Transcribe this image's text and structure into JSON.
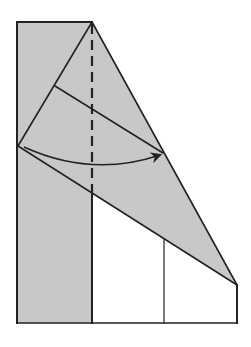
{
  "diagram": {
    "type": "origami-fold-step",
    "colors": {
      "background": "#ffffff",
      "paper_shaded": "#c8c8c8",
      "line": "#222222"
    },
    "shapes": {
      "left_strip": [
        [
          17,
          22
        ],
        [
          92,
          22
        ],
        [
          92,
          323
        ],
        [
          17,
          323
        ]
      ],
      "triangle_flap": [
        [
          18,
          146
        ],
        [
          92,
          22
        ],
        [
          237,
          285
        ]
      ],
      "lower_white_panel": [
        [
          92,
          193
        ],
        [
          237,
          285
        ],
        [
          237,
          323
        ],
        [
          92,
          323
        ]
      ]
    },
    "lines": {
      "left_edge": [
        [
          17,
          22
        ],
        [
          17,
          323
        ]
      ],
      "top_edge": [
        [
          17,
          22
        ],
        [
          92,
          22
        ]
      ],
      "long_diagonal": [
        [
          92,
          22
        ],
        [
          237,
          285
        ]
      ],
      "upper_left_diagonal": [
        [
          18,
          146
        ],
        [
          92,
          22
        ]
      ],
      "inner_crease": [
        [
          55,
          86
        ],
        [
          163,
          153
        ]
      ],
      "lower_diagonal": [
        [
          18,
          146
        ],
        [
          237,
          285
        ]
      ],
      "right_edge": [
        [
          237,
          285
        ],
        [
          237,
          323
        ]
      ],
      "middle_vertical": [
        [
          164,
          238
        ],
        [
          164,
          323
        ]
      ],
      "strip_right_edge": [
        [
          92,
          193
        ],
        [
          92,
          323
        ]
      ],
      "bottom_edge": [
        [
          17,
          323
        ],
        [
          237,
          323
        ]
      ]
    },
    "fold_line": {
      "style": "dashed",
      "from": [
        92,
        22
      ],
      "to": [
        92,
        192
      ]
    },
    "arrow": {
      "from": [
        24,
        147
      ],
      "control": [
        92,
        178
      ],
      "to": [
        160,
        155
      ],
      "meaning": "fold-direction"
    }
  }
}
